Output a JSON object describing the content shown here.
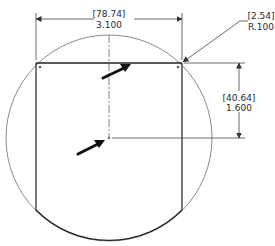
{
  "drawing": {
    "width_dim": {
      "metric": "[78.74]",
      "imperial": "3.100"
    },
    "height_dim": {
      "metric": "[40.64]",
      "imperial": "1.600"
    },
    "radius_dim": {
      "metric": "[2.54]",
      "imperial": "R.100"
    }
  },
  "colors": {
    "line": "#333333",
    "circle": "#8a8a8a",
    "arrow": "#111111"
  }
}
